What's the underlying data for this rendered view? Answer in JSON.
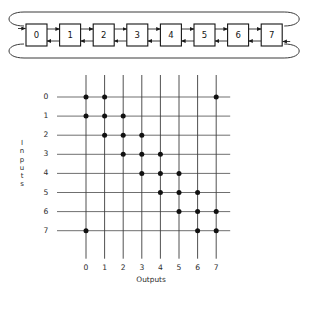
{
  "figure": {
    "title_text": "",
    "ring": {
      "name": "bidirectional-ring-chain",
      "nodes": [
        {
          "label": "0"
        },
        {
          "label": "1"
        },
        {
          "label": "2"
        },
        {
          "label": "3"
        },
        {
          "label": "4"
        },
        {
          "label": "5"
        },
        {
          "label": "6"
        },
        {
          "label": "7"
        }
      ],
      "link_style": "bidirectional",
      "wraparound": true,
      "wrap_top_label": "",
      "wrap_bottom_label": ""
    },
    "matrix": {
      "name": "crossbar-connection-matrix",
      "y_axis_title": "Inputs",
      "y_axis_title_letters": [
        "I",
        "n",
        "p",
        "u",
        "t",
        "s"
      ],
      "x_axis_title": "Outputs",
      "row_labels": [
        "0",
        "1",
        "2",
        "3",
        "4",
        "5",
        "6",
        "7"
      ],
      "column_labels": [
        "0",
        "1",
        "2",
        "3",
        "4",
        "5",
        "6",
        "7"
      ]
    },
    "colors": {
      "background": "#ffffff",
      "ink": "#141414",
      "grid": "#555555",
      "dot": "#111111"
    }
  },
  "chart_data": {
    "type": "scatter",
    "title": "",
    "subtitle": "",
    "xlabel": "Outputs",
    "ylabel": "Inputs",
    "xticklabels": [
      "0",
      "1",
      "2",
      "3",
      "4",
      "5",
      "6",
      "7"
    ],
    "yticklabels": [
      "0",
      "1",
      "2",
      "3",
      "4",
      "5",
      "6",
      "7"
    ],
    "xlim": [
      -0.6,
      7.6
    ],
    "ylim": [
      -0.6,
      7.6
    ],
    "y_axis_inverted": true,
    "grid": true,
    "legend": "none",
    "marker": "filled-circle",
    "matrix": [
      [
        1,
        1,
        0,
        0,
        0,
        0,
        0,
        1
      ],
      [
        1,
        1,
        1,
        0,
        0,
        0,
        0,
        0
      ],
      [
        0,
        1,
        1,
        1,
        0,
        0,
        0,
        0
      ],
      [
        0,
        0,
        1,
        1,
        1,
        0,
        0,
        0
      ],
      [
        0,
        0,
        0,
        1,
        1,
        1,
        0,
        0
      ],
      [
        0,
        0,
        0,
        0,
        1,
        1,
        1,
        0
      ],
      [
        0,
        0,
        0,
        0,
        0,
        1,
        1,
        1
      ],
      [
        1,
        0,
        0,
        0,
        0,
        0,
        1,
        1
      ]
    ],
    "points": [
      {
        "input": 0,
        "output": 0
      },
      {
        "input": 0,
        "output": 1
      },
      {
        "input": 0,
        "output": 7
      },
      {
        "input": 1,
        "output": 0
      },
      {
        "input": 1,
        "output": 1
      },
      {
        "input": 1,
        "output": 2
      },
      {
        "input": 2,
        "output": 1
      },
      {
        "input": 2,
        "output": 2
      },
      {
        "input": 2,
        "output": 3
      },
      {
        "input": 3,
        "output": 2
      },
      {
        "input": 3,
        "output": 3
      },
      {
        "input": 3,
        "output": 4
      },
      {
        "input": 4,
        "output": 3
      },
      {
        "input": 4,
        "output": 4
      },
      {
        "input": 4,
        "output": 5
      },
      {
        "input": 5,
        "output": 4
      },
      {
        "input": 5,
        "output": 5
      },
      {
        "input": 5,
        "output": 6
      },
      {
        "input": 6,
        "output": 5
      },
      {
        "input": 6,
        "output": 6
      },
      {
        "input": 6,
        "output": 7
      },
      {
        "input": 7,
        "output": 0
      },
      {
        "input": 7,
        "output": 6
      },
      {
        "input": 7,
        "output": 7
      }
    ]
  }
}
